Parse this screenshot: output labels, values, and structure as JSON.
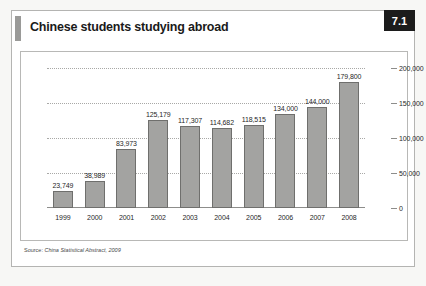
{
  "figure": {
    "title": "Chinese students studying abroad",
    "badge": "7.1",
    "source_prefix": "Source:",
    "source_text": "China Statistical Abstract, 2009"
  },
  "chart_data": {
    "type": "bar",
    "title": "Chinese students studying abroad",
    "xlabel": "",
    "ylabel": "",
    "categories": [
      "1999",
      "2000",
      "2001",
      "2002",
      "2003",
      "2004",
      "2005",
      "2006",
      "2007",
      "2008"
    ],
    "values": [
      23749,
      38989,
      83973,
      125179,
      117307,
      114682,
      118515,
      134000,
      144000,
      179800
    ],
    "value_labels": [
      "23,749",
      "38,989",
      "83,973",
      "125,179",
      "117,307",
      "114,682",
      "118,515",
      "134,000",
      "144,000",
      "179,800"
    ],
    "ylim": [
      0,
      200000
    ],
    "yticks": [
      0,
      50000,
      100000,
      150000,
      200000
    ],
    "ytick_labels": [
      "0",
      "50,000",
      "100,000",
      "150,000",
      "200,000"
    ],
    "grid": true,
    "grid_style": "dotted",
    "legend": null,
    "bar_color": "#a3a3a1",
    "bar_edge_color": "#6f6f6d",
    "axis_position": "right"
  }
}
